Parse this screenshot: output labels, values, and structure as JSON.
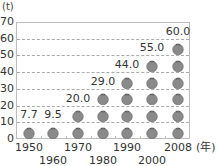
{
  "chart_data": {
    "type": "bar",
    "subtype": "pictograph",
    "title": "",
    "ylabel": "(t)",
    "xlabel": "(年)",
    "ylim": [
      0,
      70
    ],
    "yticks": [
      "0",
      "10",
      "20",
      "30",
      "40",
      "50",
      "60",
      "70"
    ],
    "grid": true,
    "categories": [
      "1950",
      "1960",
      "1970",
      "1980",
      "1990",
      "2000",
      "2008"
    ],
    "values": [
      7.7,
      9.5,
      20.0,
      29.0,
      44.0,
      55.0,
      60.0
    ],
    "value_labels": [
      "7.7",
      "9.5",
      "20.0",
      "29.0",
      "44.0",
      "55.0",
      "60.0"
    ],
    "icons_per_category": [
      1,
      1,
      2,
      3,
      4,
      5,
      6
    ],
    "icon": "tomato-icon",
    "icon_unit": 10,
    "colors": {
      "icon": "#8a8a8a",
      "icon_dark": "#666666",
      "grid": "#aaaaaa",
      "frame": "#bdbdbd"
    }
  }
}
